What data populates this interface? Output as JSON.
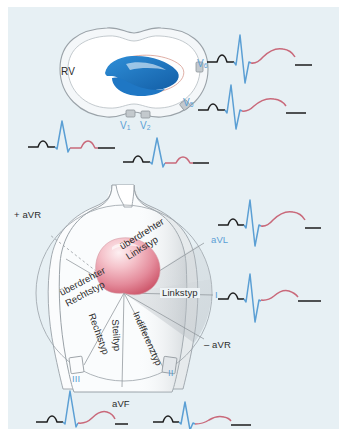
{
  "figure": {
    "background_color": "#e7f0f4",
    "colors": {
      "ecg_baseline": "#1d1d1d",
      "ecg_qrs": "#5b9fd4",
      "ecg_t_wave": "#d4737f",
      "lead_label_blue": "#5b9fd4",
      "heart_blue": "#1f77c4",
      "heart_pink_light": "#f6c9cf",
      "heart_pink_dark": "#d4566a",
      "torso_shade": "#d9dde0",
      "outline": "#8d9499"
    }
  },
  "top_panel": {
    "name": "horizontal-chest-plane",
    "structure_labels": [
      {
        "text": "RV",
        "name": "right-ventricle-label",
        "color": "dark"
      }
    ],
    "electrodes": [
      {
        "lead": "V",
        "index": "1",
        "name": "electrode-v1"
      },
      {
        "lead": "V",
        "index": "2",
        "name": "electrode-v2"
      },
      {
        "lead": "V",
        "index": "5",
        "name": "electrode-v5"
      },
      {
        "lead": "V",
        "index": "6",
        "name": "electrode-v6"
      }
    ],
    "ecg_traces": [
      {
        "name": "ecg-trace-v6",
        "lead": "V6",
        "morphology": "small P, tall R, deep S, broad positive T",
        "r_amplitude": 26,
        "s_amplitude": -17
      },
      {
        "name": "ecg-trace-v5",
        "lead": "V5",
        "morphology": "small P, tall R, deep S, broad positive T",
        "r_amplitude": 24,
        "s_amplitude": -15
      },
      {
        "name": "ecg-trace-v1",
        "lead": "V1",
        "morphology": "small P, tall narrow R, small S, low positive T",
        "r_amplitude": 24,
        "s_amplitude": -4
      },
      {
        "name": "ecg-trace-v2",
        "lead": "V2",
        "morphology": "small P, tall narrow R, small S, low positive T",
        "r_amplitude": 22,
        "s_amplitude": -4
      }
    ]
  },
  "bottom_panel": {
    "name": "frontal-axis-plane",
    "axis_type_labels": [
      {
        "text": "überdrehter Linkstyp",
        "name": "axis-label-ueberdrehter-linkstyp",
        "line1": "überdrehter",
        "line2": "Linkstyp",
        "rotation": -32
      },
      {
        "text": "Linkstyp",
        "name": "axis-label-linkstyp",
        "rotation": 0
      },
      {
        "text": "Indifferenztyp",
        "name": "axis-label-indifferenztyp",
        "rotation": 66
      },
      {
        "text": "Steiltyp",
        "name": "axis-label-steiltyp",
        "rotation": 86
      },
      {
        "text": "Rechtstyp",
        "name": "axis-label-rechtstyp",
        "rotation": 70
      },
      {
        "text": "überdrehter Rechtstyp",
        "name": "axis-label-ueberdrehter-rechtstyp",
        "line1": "überdrehter",
        "line2": "Rechtstyp",
        "rotation": -28
      }
    ],
    "lead_labels": [
      {
        "text": "+ aVR",
        "name": "lead-label-plus-avr",
        "color": "dark"
      },
      {
        "text": "aVL",
        "name": "lead-label-avl",
        "color": "blue"
      },
      {
        "text": "I",
        "name": "lead-label-i",
        "color": "blue"
      },
      {
        "text": "– aVR",
        "name": "lead-label-minus-avr",
        "color": "dark"
      },
      {
        "text": "II",
        "name": "lead-label-ii",
        "color": "blue"
      },
      {
        "text": "aVF",
        "name": "lead-label-avf",
        "color": "dark"
      },
      {
        "text": "III",
        "name": "lead-label-iii",
        "color": "blue"
      }
    ],
    "ecg_traces": [
      {
        "name": "ecg-trace-avl",
        "lead": "aVL",
        "morphology": "small P, tall R, deep S, broad positive T",
        "r_amplitude": 26,
        "s_amplitude": -19
      },
      {
        "name": "ecg-trace-i",
        "lead": "I",
        "morphology": "small P, tall R, deep S, low positive T",
        "r_amplitude": 25,
        "s_amplitude": -20
      },
      {
        "name": "ecg-trace-iii",
        "lead": "III",
        "morphology": "small P, tall narrow R, low positive T",
        "r_amplitude": 30,
        "s_amplitude": -3
      },
      {
        "name": "ecg-trace-ii",
        "lead": "II",
        "morphology": "small P, moderate R, small S, low positive T",
        "r_amplitude": 20,
        "s_amplitude": -6
      }
    ]
  }
}
